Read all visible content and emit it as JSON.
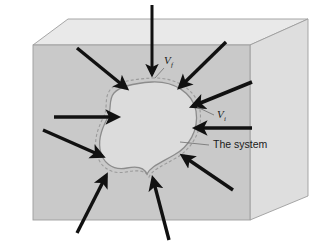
{
  "figure": {
    "background_color": "#ffffff",
    "labels": [
      {
        "id": "volume-final",
        "symbol": "V",
        "subscript": "f",
        "x": 165,
        "y": 62,
        "leader": {
          "x1": 162,
          "y1": 66,
          "x2": 152,
          "y2": 77
        }
      },
      {
        "id": "volume-initial",
        "symbol": "V",
        "subscript": "i",
        "x": 218,
        "y": 118,
        "leader": {
          "x1": 214,
          "y1": 116,
          "x2": 198,
          "y2": 108
        }
      },
      {
        "id": "system-label",
        "text": "The system",
        "x": 213,
        "y": 148,
        "leader": {
          "x1": 209,
          "y1": 145,
          "x2": 180,
          "y2": 142
        }
      }
    ],
    "box": {
      "top_face_color": "#e9e9e9",
      "front_face_color": "#c9c9c9",
      "right_face_color": "#dedede",
      "edge_color": "#9a9a9a",
      "front": {
        "x": 33,
        "y": 45,
        "w": 217,
        "h": 175
      },
      "top_back_left": {
        "x": 68,
        "y": 19
      },
      "top_back_right": {
        "x": 308,
        "y": 19
      },
      "right_back_bottom": {
        "x": 308,
        "y": 196
      }
    },
    "blob": {
      "fill_color": "#dcdcdc",
      "outline_color": "#8c8c8c",
      "dashed_outline_color": "#9b9b9b",
      "dash_pattern": "3 2"
    },
    "arrows": {
      "color": "#111111",
      "count": 11,
      "description": "Thick black arrows pointing inward toward the system boundary from all directions",
      "items": [
        {
          "id": "arrow-top",
          "x1": 152,
          "y1": 5,
          "x2": 152,
          "y2": 77,
          "width": 3.0
        },
        {
          "id": "arrow-top-left",
          "x1": 77,
          "y1": 48,
          "x2": 129,
          "y2": 91,
          "width": 3.4
        },
        {
          "id": "arrow-top-right",
          "x1": 223,
          "y1": 44,
          "x2": 177,
          "y2": 90,
          "width": 3.4
        },
        {
          "id": "arrow-right-upper",
          "x1": 250,
          "y1": 84,
          "x2": 189,
          "y2": 108,
          "width": 3.6
        },
        {
          "id": "arrow-right-mid",
          "x1": 250,
          "y1": 128,
          "x2": 192,
          "y2": 128,
          "width": 3.4
        },
        {
          "id": "arrow-left-mid",
          "x1": 54,
          "y1": 116,
          "x2": 121,
          "y2": 117,
          "width": 3.4
        },
        {
          "id": "arrow-left-lower",
          "x1": 44,
          "y1": 131,
          "x2": 105,
          "y2": 158,
          "width": 3.4
        },
        {
          "id": "arrow-right-lower",
          "x1": 231,
          "y1": 189,
          "x2": 180,
          "y2": 155,
          "width": 3.4
        },
        {
          "id": "arrow-bottom-left",
          "x1": 78,
          "y1": 231,
          "x2": 109,
          "y2": 172,
          "width": 3.4
        },
        {
          "id": "arrow-bottom-right",
          "x1": 168,
          "y1": 238,
          "x2": 152,
          "y2": 175,
          "width": 3.4
        }
      ]
    }
  }
}
